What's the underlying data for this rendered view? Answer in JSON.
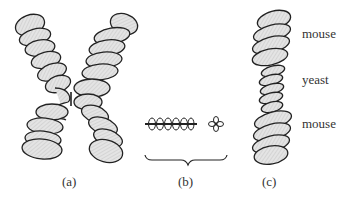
{
  "figure": {
    "panels": [
      {
        "id": "a",
        "label": "(a)",
        "description": "metaphase chromosome with two coiled chromatids joined at centromere"
      },
      {
        "id": "b",
        "label": "(b)",
        "description": "coiled chromatin fiber and rosette, bracketed"
      },
      {
        "id": "c",
        "label": "(c)",
        "description": "hybrid coiled chromosome with mouse-yeast-mouse segments"
      }
    ],
    "segment_labels": [
      "mouse",
      "yeast",
      "mouse"
    ],
    "colors": {
      "fill": "#d9d9d9",
      "stroke": "#222222"
    }
  }
}
